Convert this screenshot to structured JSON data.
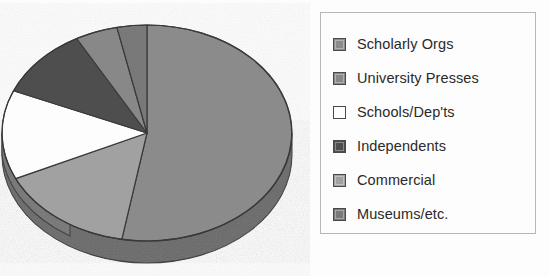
{
  "chart_data": {
    "type": "pie",
    "title": "",
    "subtitle": "",
    "xlabel": "",
    "ylabel": "",
    "legend_position": "right",
    "grid": false,
    "three_d": true,
    "categories": [
      "Scholarly Orgs",
      "University Presses",
      "Schools/Dep'ts",
      "Independents",
      "Commercial",
      "Museums/etc."
    ],
    "values": [
      52.8,
      4.7,
      13.3,
      10.6,
      15.3,
      3.3
    ],
    "units": "percent",
    "slice_angles_deg": [
      190,
      17,
      48,
      38,
      55,
      12
    ],
    "colors": [
      "#8d8d8d",
      "#8a8a8a",
      "#ffffff",
      "#4f4f4f",
      "#a3a3a3",
      "#7a7a7a"
    ],
    "start_angle_deg": 0,
    "direction": "clockwise",
    "series": [
      {
        "name": "Publisher type share",
        "points": [
          {
            "label": "Scholarly Orgs",
            "value": 52.8,
            "color": "#8d8d8d"
          },
          {
            "label": "University Presses",
            "value": 4.7,
            "color": "#8a8a8a"
          },
          {
            "label": "Schools/Dep'ts",
            "value": 13.3,
            "color": "#ffffff"
          },
          {
            "label": "Independents",
            "value": 10.6,
            "color": "#4f4f4f"
          },
          {
            "label": "Commercial",
            "value": 15.3,
            "color": "#a3a3a3"
          },
          {
            "label": "Museums/etc.",
            "value": 3.3,
            "color": "#7a7a7a"
          }
        ]
      }
    ]
  },
  "legend": {
    "items": [
      {
        "label": "Scholarly Orgs",
        "swatch": "#8d8d8d",
        "icon": "legend-swatch-icon"
      },
      {
        "label": "University Presses",
        "swatch": "#8a8a8a",
        "icon": "legend-swatch-icon"
      },
      {
        "label": "Schools/Dep'ts",
        "swatch": "#ffffff",
        "icon": "legend-swatch-icon"
      },
      {
        "label": "Independents",
        "swatch": "#4f4f4f",
        "icon": "legend-swatch-icon"
      },
      {
        "label": "Commercial",
        "swatch": "#a3a3a3",
        "icon": "legend-swatch-icon"
      },
      {
        "label": "Museums/etc.",
        "swatch": "#7a7a7a",
        "icon": "legend-swatch-icon"
      }
    ]
  },
  "theme": {
    "page_background": "#ffffff",
    "legend_border": "#b9b9b9",
    "text_color": "#2b2b2b",
    "slice_outline": "#3a3a3a",
    "depth_shade": "#5f5f5f"
  }
}
